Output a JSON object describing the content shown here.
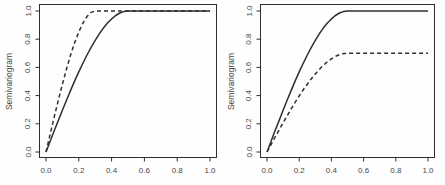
{
  "figure": {
    "background_color": "#fefefe",
    "line_color": "#2f2f2f",
    "text_color": "#474747"
  },
  "chart_data": [
    {
      "type": "line",
      "panel": "left",
      "title": "",
      "xlabel": "",
      "ylabel": "Semivariogram",
      "xlim": [
        0.0,
        1.0
      ],
      "ylim": [
        0.0,
        1.0
      ],
      "grid": false,
      "legend": null,
      "xticks": [
        "0.0",
        "0.2",
        "0.4",
        "0.6",
        "0.8",
        "1.0"
      ],
      "yticks": [
        "0.0",
        "0.2",
        "0.4",
        "0.6",
        "0.8",
        "1.0"
      ],
      "series": [
        {
          "name": "spherical model, range 0.5, sill 1.0",
          "line_style": "solid",
          "model": "spherical",
          "sill": 1.0,
          "range": 0.5,
          "x": [
            0,
            0.025,
            0.05,
            0.075,
            0.1,
            0.125,
            0.15,
            0.175,
            0.2,
            0.225,
            0.25,
            0.275,
            0.3,
            0.325,
            0.35,
            0.375,
            0.4,
            0.425,
            0.45,
            0.475,
            0.5,
            0.6,
            0.7,
            0.8,
            0.9,
            1
          ],
          "y": [
            0,
            0.075,
            0.15,
            0.223,
            0.296,
            0.367,
            0.437,
            0.504,
            0.568,
            0.629,
            0.688,
            0.742,
            0.792,
            0.838,
            0.879,
            0.914,
            0.944,
            0.968,
            0.986,
            0.996,
            1,
            1,
            1,
            1,
            1,
            1
          ]
        },
        {
          "name": "spherical model, range 0.3, sill 1.0",
          "line_style": "dashed",
          "model": "spherical",
          "sill": 1.0,
          "range": 0.3,
          "x": [
            0,
            0.025,
            0.05,
            0.075,
            0.1,
            0.125,
            0.15,
            0.175,
            0.2,
            0.225,
            0.25,
            0.275,
            0.3,
            0.4,
            0.5,
            0.6,
            0.7,
            0.8,
            0.9,
            1
          ],
          "y": [
            0,
            0.125,
            0.248,
            0.367,
            0.481,
            0.589,
            0.688,
            0.776,
            0.852,
            0.914,
            0.961,
            0.99,
            1,
            1,
            1,
            1,
            1,
            1,
            1,
            1
          ]
        }
      ]
    },
    {
      "type": "line",
      "panel": "right",
      "title": "",
      "xlabel": "",
      "ylabel": "Semivariogram",
      "xlim": [
        0.0,
        1.0
      ],
      "ylim": [
        0.0,
        1.0
      ],
      "grid": false,
      "legend": null,
      "xticks": [
        "0.0",
        "0.2",
        "0.4",
        "0.6",
        "0.8",
        "1.0"
      ],
      "yticks": [
        "0.0",
        "0.2",
        "0.4",
        "0.6",
        "0.8",
        "1.0"
      ],
      "series": [
        {
          "name": "spherical model, range 0.5, sill 1.0",
          "line_style": "solid",
          "model": "spherical",
          "sill": 1.0,
          "range": 0.5,
          "x": [
            0,
            0.025,
            0.05,
            0.075,
            0.1,
            0.125,
            0.15,
            0.175,
            0.2,
            0.225,
            0.25,
            0.275,
            0.3,
            0.325,
            0.35,
            0.375,
            0.4,
            0.425,
            0.45,
            0.475,
            0.5,
            0.6,
            0.7,
            0.8,
            0.9,
            1
          ],
          "y": [
            0,
            0.075,
            0.15,
            0.223,
            0.296,
            0.367,
            0.437,
            0.504,
            0.568,
            0.629,
            0.688,
            0.742,
            0.792,
            0.838,
            0.879,
            0.914,
            0.944,
            0.968,
            0.986,
            0.996,
            1,
            1,
            1,
            1,
            1,
            1
          ]
        },
        {
          "name": "spherical model, range 0.5, sill 0.7",
          "line_style": "dashed",
          "model": "spherical",
          "sill": 0.7,
          "range": 0.5,
          "x": [
            0,
            0.025,
            0.05,
            0.075,
            0.1,
            0.125,
            0.15,
            0.175,
            0.2,
            0.225,
            0.25,
            0.275,
            0.3,
            0.325,
            0.35,
            0.375,
            0.4,
            0.425,
            0.45,
            0.475,
            0.5,
            0.6,
            0.7,
            0.8,
            0.9,
            1
          ],
          "y": [
            0,
            0.052,
            0.105,
            0.156,
            0.207,
            0.257,
            0.306,
            0.353,
            0.398,
            0.441,
            0.481,
            0.519,
            0.554,
            0.586,
            0.615,
            0.64,
            0.661,
            0.678,
            0.69,
            0.698,
            0.7,
            0.7,
            0.7,
            0.7,
            0.7,
            0.7
          ]
        }
      ]
    }
  ]
}
